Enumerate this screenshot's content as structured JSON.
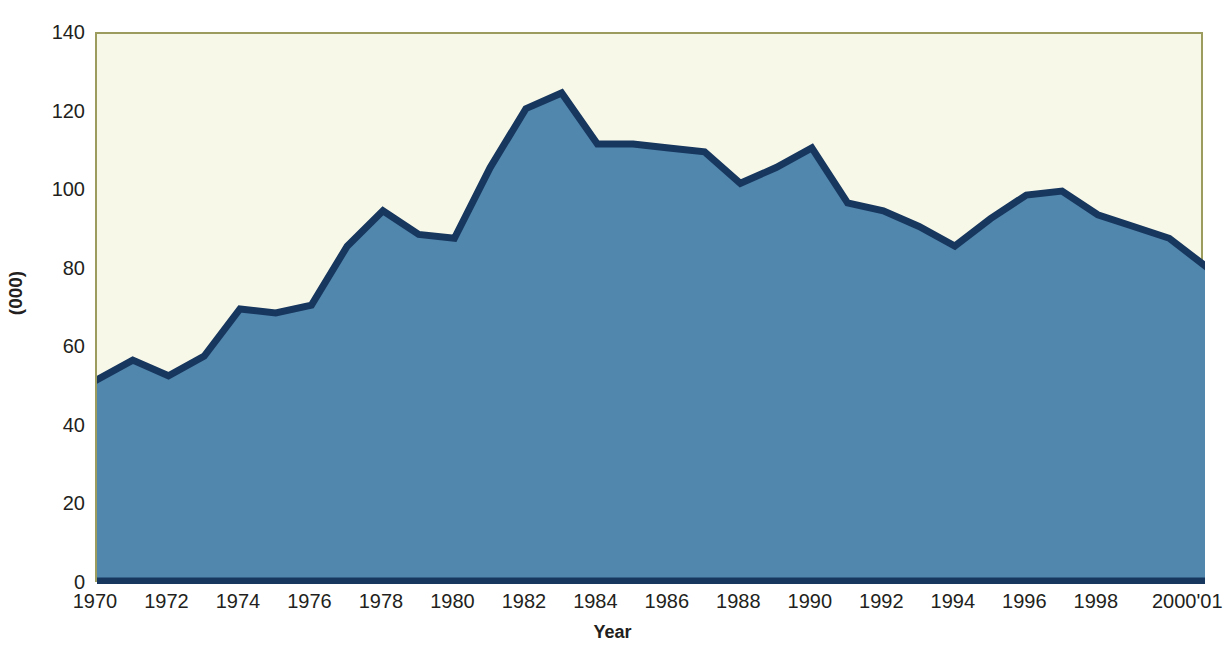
{
  "chart_data": {
    "type": "area",
    "title": "",
    "xlabel": "Year",
    "ylabel": "(000)",
    "ylim": [
      0,
      140
    ],
    "ytick_labels": [
      "140",
      "120",
      "100",
      "80",
      "60",
      "40",
      "20",
      "0"
    ],
    "ytick_values": [
      140,
      120,
      100,
      80,
      60,
      40,
      20,
      0
    ],
    "xtick_labels": [
      "1970",
      "1972",
      "1974",
      "1976",
      "1978",
      "1980",
      "1982",
      "1984",
      "1986",
      "1988",
      "1990",
      "1992",
      "1994",
      "1996",
      "1998",
      "2000'01"
    ],
    "xtick_values": [
      1970,
      1972,
      1974,
      1976,
      1978,
      1980,
      1982,
      1984,
      1986,
      1988,
      1990,
      1992,
      1994,
      1996,
      1998,
      2000
    ],
    "grid": false,
    "legend": null,
    "x": [
      1970,
      1971,
      1972,
      1973,
      1974,
      1975,
      1976,
      1977,
      1978,
      1979,
      1980,
      1981,
      1982,
      1983,
      1984,
      1985,
      1986,
      1987,
      1988,
      1989,
      1990,
      1991,
      1992,
      1993,
      1994,
      1995,
      1996,
      1997,
      1998,
      1999,
      2000,
      2001
    ],
    "values": [
      52,
      57,
      53,
      58,
      70,
      69,
      71,
      86,
      95,
      89,
      88,
      106,
      121,
      125,
      112,
      112,
      111,
      110,
      102,
      106,
      111,
      97,
      95,
      91,
      86,
      93,
      99,
      100,
      94,
      91,
      88,
      81
    ],
    "series": [
      {
        "name": "value",
        "values": [
          52,
          57,
          53,
          58,
          70,
          69,
          71,
          86,
          95,
          89,
          88,
          106,
          121,
          125,
          112,
          112,
          111,
          110,
          102,
          106,
          111,
          97,
          95,
          91,
          86,
          93,
          99,
          100,
          94,
          91,
          88,
          81
        ]
      }
    ],
    "colors": {
      "area_fill": "#5186ad",
      "line": "#17375e",
      "plot_background": "#f8f8e9",
      "frame": "#9c9c5e",
      "text": "#231f20",
      "page_background": "#ffffff"
    }
  },
  "axes": {
    "y": {
      "label": "(000)",
      "ticks": [
        {
          "label": "140",
          "value": 140
        },
        {
          "label": "120",
          "value": 120
        },
        {
          "label": "100",
          "value": 100
        },
        {
          "label": "80",
          "value": 80
        },
        {
          "label": "60",
          "value": 60
        },
        {
          "label": "40",
          "value": 40
        },
        {
          "label": "20",
          "value": 20
        },
        {
          "label": "0",
          "value": 0
        }
      ]
    },
    "x": {
      "label": "Year",
      "ticks": [
        {
          "label": "1970",
          "value": 1970
        },
        {
          "label": "1972",
          "value": 1972
        },
        {
          "label": "1974",
          "value": 1974
        },
        {
          "label": "1976",
          "value": 1976
        },
        {
          "label": "1978",
          "value": 1978
        },
        {
          "label": "1980",
          "value": 1980
        },
        {
          "label": "1982",
          "value": 1982
        },
        {
          "label": "1984",
          "value": 1984
        },
        {
          "label": "1986",
          "value": 1986
        },
        {
          "label": "1988",
          "value": 1988
        },
        {
          "label": "1990",
          "value": 1990
        },
        {
          "label": "1992",
          "value": 1992
        },
        {
          "label": "1994",
          "value": 1994
        },
        {
          "label": "1996",
          "value": 1996
        },
        {
          "label": "1998",
          "value": 1998
        },
        {
          "label": "2000'01",
          "value": 2000
        }
      ]
    }
  }
}
